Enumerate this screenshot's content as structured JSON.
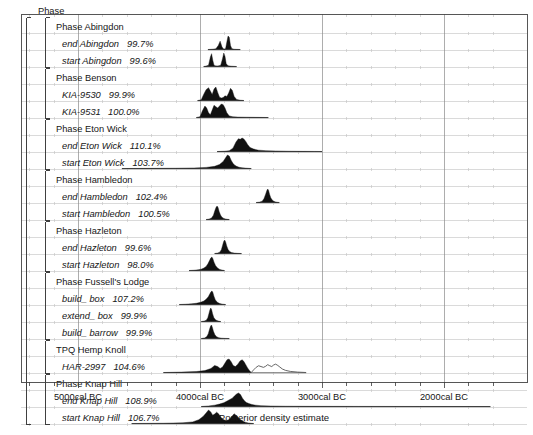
{
  "figure": {
    "axis_title": "Posterior density estimate",
    "root_label": "Phase",
    "frame": {
      "x": 21,
      "y": 14,
      "width": 506,
      "height": 368
    },
    "plot_left_px": 195,
    "colors": {
      "fill": "#111111",
      "outline": "#555555",
      "frame": "#444444",
      "grid_major": "#8a8a8a",
      "grid_minor": "#c8c8c8",
      "row_rule": "#b8b8b8",
      "text": "#161616"
    }
  },
  "x_axis": {
    "ticks": [
      {
        "label": "5000cal BC",
        "value": -5000,
        "x": 78
      },
      {
        "label": "4000cal BC",
        "value": -4000,
        "x": 200
      },
      {
        "label": "3000cal BC",
        "value": -3000,
        "x": 322
      },
      {
        "label": "2000cal BC",
        "value": -2000,
        "x": 444
      }
    ],
    "minor_tick_interval_years": 200,
    "px_per_1000_years": 122,
    "range": [
      -5450,
      -1550
    ]
  },
  "rows": [
    {
      "id": "phase-abingdon",
      "label": "Phase Abingdon",
      "kind": "phase",
      "indent": 2,
      "percent": "",
      "y": 33
    },
    {
      "id": "end-abingdon",
      "label": "end Abingdon",
      "kind": "item",
      "indent": 3,
      "percent": "99.7%",
      "y": 50
    },
    {
      "id": "start-abingdon",
      "label": "start Abingdon",
      "kind": "item",
      "indent": 3,
      "percent": "99.6%",
      "y": 67
    },
    {
      "id": "phase-benson",
      "label": "Phase Benson",
      "kind": "phase",
      "indent": 2,
      "percent": "",
      "y": 84
    },
    {
      "id": "kia-9530",
      "label": "KIA-9530",
      "kind": "item",
      "indent": 3,
      "percent": "99.9%",
      "y": 101
    },
    {
      "id": "kia-9531",
      "label": "KIA-9531",
      "kind": "item",
      "indent": 3,
      "percent": "100.0%",
      "y": 118
    },
    {
      "id": "phase-eton-wick",
      "label": "Phase Eton Wick",
      "kind": "phase",
      "indent": 2,
      "percent": "",
      "y": 135
    },
    {
      "id": "end-eton-wick",
      "label": "end Eton Wick",
      "kind": "item",
      "indent": 3,
      "percent": "110.1%",
      "y": 152
    },
    {
      "id": "start-eton-wick",
      "label": "start Eton Wick",
      "kind": "item",
      "indent": 3,
      "percent": "103.7%",
      "y": 169
    },
    {
      "id": "phase-hambledon",
      "label": "Phase Hambledon",
      "kind": "phase",
      "indent": 2,
      "percent": "",
      "y": 186
    },
    {
      "id": "end-hambledon",
      "label": "end Hambledon",
      "kind": "item",
      "indent": 3,
      "percent": "102.4%",
      "y": 203
    },
    {
      "id": "start-hambledon",
      "label": "start Hambledon",
      "kind": "item",
      "indent": 3,
      "percent": "100.5%",
      "y": 220
    },
    {
      "id": "phase-hazleton",
      "label": "Phase Hazleton",
      "kind": "phase",
      "indent": 2,
      "percent": "",
      "y": 237
    },
    {
      "id": "end-hazleton",
      "label": "end Hazleton",
      "kind": "item",
      "indent": 3,
      "percent": "99.6%",
      "y": 254
    },
    {
      "id": "start-hazleton",
      "label": "start Hazleton",
      "kind": "item",
      "indent": 3,
      "percent": "98.0%",
      "y": 271
    },
    {
      "id": "phase-fussells-lodge",
      "label": "Phase Fussell's Lodge",
      "kind": "phase",
      "indent": 2,
      "percent": "",
      "y": 288
    },
    {
      "id": "build-box",
      "label": "build_ box",
      "kind": "item",
      "indent": 3,
      "percent": "107.2%",
      "y": 305
    },
    {
      "id": "extend-box",
      "label": "extend_ box",
      "kind": "item",
      "indent": 3,
      "percent": "99.9%",
      "y": 322
    },
    {
      "id": "build-barrow",
      "label": "build_ barrow",
      "kind": "item",
      "indent": 3,
      "percent": "99.9%",
      "y": 339
    },
    {
      "id": "tpq-hemp-knoll",
      "label": "TPQ Hemp Knoll",
      "kind": "phase",
      "indent": 2,
      "percent": "",
      "y": 356
    },
    {
      "id": "har-2997",
      "label": "HAR-2997",
      "kind": "item",
      "indent": 3,
      "percent": "104.6%",
      "y": 373
    },
    {
      "id": "phase-knap-hill",
      "label": "Phase Knap Hill",
      "kind": "phase",
      "indent": 2,
      "percent": "",
      "y": 390
    },
    {
      "id": "end-knap-hill",
      "label": "end Knap Hill",
      "kind": "item",
      "indent": 3,
      "percent": "108.9%",
      "y": 407
    },
    {
      "id": "start-knap-hill",
      "label": "start Knap Hill",
      "kind": "item",
      "indent": 3,
      "percent": "106.7%",
      "y": 424
    }
  ],
  "chart_data": {
    "type": "area",
    "title": "",
    "xlabel": "Posterior density estimate",
    "ylabel": "",
    "xlim": [
      -5450,
      -1550
    ],
    "grid": true,
    "legend": false,
    "note": "OxCal posterior density estimates; filled black = posterior, grey outline = prior/likelihood. Each series gives the calendar-year span of the baseline plus the density curve sampled across it.",
    "series": [
      {
        "name": "end Abingdon",
        "row": "end-abingdon",
        "agreement": 99.7,
        "baseline": [
          -3935,
          -3670
        ],
        "x": [
          -3935,
          -3900,
          -3870,
          -3850,
          -3835,
          -3820,
          -3810,
          -3800,
          -3790,
          -3780,
          -3770,
          -3760,
          -3750,
          -3740,
          -3730,
          -3720,
          -3700,
          -3670
        ],
        "y": [
          0,
          0.02,
          0.05,
          0.3,
          0.62,
          0.2,
          0.06,
          0.04,
          0.08,
          0.55,
          1.0,
          0.9,
          0.3,
          0.08,
          0.04,
          0.02,
          0.01,
          0
        ]
      },
      {
        "name": "start Abingdon",
        "row": "start-abingdon",
        "agreement": 99.6,
        "baseline": [
          -3970,
          -3700
        ],
        "x": [
          -3970,
          -3950,
          -3930,
          -3915,
          -3905,
          -3895,
          -3885,
          -3875,
          -3860,
          -3845,
          -3830,
          -3815,
          -3805,
          -3795,
          -3785,
          -3770,
          -3740,
          -3700
        ],
        "y": [
          0,
          0.03,
          0.1,
          0.7,
          0.95,
          0.45,
          0.1,
          0.05,
          0.04,
          0.05,
          0.1,
          0.6,
          1.0,
          0.75,
          0.2,
          0.05,
          0.02,
          0
        ]
      },
      {
        "name": "KIA-9530",
        "row": "kia-9530",
        "agreement": 99.9,
        "baseline": [
          -4020,
          -3640
        ],
        "x": [
          -4020,
          -3990,
          -3970,
          -3950,
          -3930,
          -3915,
          -3900,
          -3885,
          -3870,
          -3855,
          -3840,
          -3825,
          -3810,
          -3795,
          -3780,
          -3765,
          -3750,
          -3735,
          -3720,
          -3700,
          -3670,
          -3640
        ],
        "y": [
          0,
          0.05,
          0.45,
          0.8,
          0.95,
          0.7,
          0.45,
          0.85,
          1.0,
          0.6,
          0.25,
          0.18,
          0.22,
          0.35,
          0.3,
          0.55,
          0.9,
          0.75,
          0.3,
          0.08,
          0.02,
          0
        ]
      },
      {
        "name": "KIA-9531",
        "row": "kia-9531",
        "agreement": 100.0,
        "baseline": [
          -4030,
          -3440
        ],
        "x": [
          -4030,
          -4000,
          -3980,
          -3960,
          -3945,
          -3930,
          -3915,
          -3900,
          -3885,
          -3870,
          -3855,
          -3840,
          -3825,
          -3810,
          -3795,
          -3780,
          -3760,
          -3730,
          -3690,
          -3620,
          -3530,
          -3440
        ],
        "y": [
          0,
          0.06,
          0.5,
          0.85,
          0.7,
          0.35,
          0.2,
          0.55,
          0.9,
          0.8,
          0.7,
          0.85,
          1.0,
          0.95,
          0.7,
          0.35,
          0.12,
          0.05,
          0.03,
          0.02,
          0.01,
          0
        ]
      },
      {
        "name": "end Eton Wick",
        "row": "end-eton-wick",
        "agreement": 110.1,
        "baseline": [
          -3860,
          -3000
        ],
        "x": [
          -3860,
          -3800,
          -3760,
          -3730,
          -3705,
          -3685,
          -3670,
          -3655,
          -3640,
          -3625,
          -3610,
          -3590,
          -3560,
          -3520,
          -3460,
          -3380,
          -3280,
          -3160,
          -3060,
          -3000
        ],
        "y": [
          0,
          0.02,
          0.06,
          0.25,
          0.7,
          0.95,
          0.9,
          1.0,
          0.92,
          0.75,
          0.52,
          0.3,
          0.18,
          0.1,
          0.06,
          0.04,
          0.02,
          0.01,
          0.005,
          0
        ]
      },
      {
        "name": "start Eton Wick",
        "row": "start-eton-wick",
        "agreement": 103.7,
        "baseline": [
          -4640,
          -3580
        ],
        "x": [
          -4640,
          -4400,
          -4200,
          -4050,
          -3950,
          -3880,
          -3840,
          -3810,
          -3790,
          -3775,
          -3760,
          -3745,
          -3730,
          -3715,
          -3700,
          -3680,
          -3655,
          -3630,
          -3600,
          -3580
        ],
        "y": [
          0,
          0.01,
          0.02,
          0.04,
          0.08,
          0.16,
          0.3,
          0.52,
          0.8,
          1.0,
          0.92,
          0.62,
          0.38,
          0.24,
          0.16,
          0.09,
          0.05,
          0.03,
          0.01,
          0
        ]
      },
      {
        "name": "end Hambledon",
        "row": "end-hambledon",
        "agreement": 102.4,
        "baseline": [
          -3540,
          -3350
        ],
        "x": [
          -3540,
          -3510,
          -3490,
          -3475,
          -3462,
          -3452,
          -3445,
          -3438,
          -3430,
          -3420,
          -3408,
          -3395,
          -3380,
          -3365,
          -3350
        ],
        "y": [
          0,
          0.03,
          0.1,
          0.3,
          0.62,
          0.88,
          1.0,
          0.9,
          0.62,
          0.35,
          0.18,
          0.09,
          0.04,
          0.015,
          0
        ]
      },
      {
        "name": "start Hambledon",
        "row": "start-hambledon",
        "agreement": 100.5,
        "baseline": [
          -3950,
          -3760
        ],
        "x": [
          -3950,
          -3925,
          -3905,
          -3890,
          -3878,
          -3868,
          -3860,
          -3852,
          -3843,
          -3832,
          -3820,
          -3805,
          -3790,
          -3775,
          -3760
        ],
        "y": [
          0,
          0.03,
          0.12,
          0.32,
          0.66,
          0.9,
          1.0,
          0.88,
          0.6,
          0.33,
          0.16,
          0.08,
          0.035,
          0.012,
          0
        ]
      },
      {
        "name": "end Hazleton",
        "row": "end-hazleton",
        "agreement": 99.6,
        "baseline": [
          -3880,
          -3660
        ],
        "x": [
          -3880,
          -3855,
          -3838,
          -3825,
          -3815,
          -3806,
          -3798,
          -3790,
          -3781,
          -3770,
          -3757,
          -3742,
          -3720,
          -3690,
          -3660
        ],
        "y": [
          0,
          0.03,
          0.1,
          0.28,
          0.6,
          0.88,
          1.0,
          0.86,
          0.56,
          0.3,
          0.15,
          0.07,
          0.03,
          0.01,
          0
        ]
      },
      {
        "name": "start Hazleton",
        "row": "start-hazleton",
        "agreement": 98.0,
        "baseline": [
          -4090,
          -3800
        ],
        "x": [
          -4090,
          -4050,
          -4015,
          -3990,
          -3968,
          -3950,
          -3935,
          -3922,
          -3912,
          -3903,
          -3895,
          -3885,
          -3872,
          -3856,
          -3838,
          -3820,
          -3800
        ],
        "y": [
          0,
          0.02,
          0.05,
          0.1,
          0.18,
          0.3,
          0.5,
          0.74,
          0.92,
          1.0,
          0.88,
          0.62,
          0.36,
          0.18,
          0.08,
          0.03,
          0
        ]
      },
      {
        "name": "build_ box",
        "row": "build-box",
        "agreement": 107.2,
        "baseline": [
          -4170,
          -3790
        ],
        "x": [
          -4170,
          -4120,
          -4070,
          -4030,
          -3995,
          -3968,
          -3948,
          -3932,
          -3920,
          -3910,
          -3902,
          -3895,
          -3886,
          -3874,
          -3858,
          -3838,
          -3815,
          -3790
        ],
        "y": [
          0,
          0.02,
          0.05,
          0.09,
          0.16,
          0.26,
          0.4,
          0.58,
          0.78,
          0.94,
          1.0,
          0.9,
          0.62,
          0.34,
          0.16,
          0.07,
          0.025,
          0
        ]
      },
      {
        "name": "extend_ box",
        "row": "extend-box",
        "agreement": 99.9,
        "baseline": [
          -3990,
          -3830
        ],
        "x": [
          -3990,
          -3965,
          -3948,
          -3936,
          -3927,
          -3919,
          -3912,
          -3905,
          -3897,
          -3887,
          -3875,
          -3862,
          -3848,
          -3838,
          -3830
        ],
        "y": [
          0,
          0.03,
          0.1,
          0.28,
          0.58,
          0.86,
          1.0,
          0.88,
          0.58,
          0.3,
          0.15,
          0.07,
          0.03,
          0.01,
          0
        ]
      },
      {
        "name": "build_ barrow",
        "row": "build-barrow",
        "agreement": 99.9,
        "baseline": [
          -3990,
          -3760
        ],
        "x": [
          -3990,
          -3962,
          -3944,
          -3932,
          -3922,
          -3913,
          -3906,
          -3899,
          -3890,
          -3878,
          -3864,
          -3846,
          -3824,
          -3795,
          -3760
        ],
        "y": [
          0,
          0.04,
          0.14,
          0.36,
          0.68,
          0.92,
          1.0,
          0.84,
          0.54,
          0.28,
          0.13,
          0.06,
          0.025,
          0.008,
          0
        ]
      },
      {
        "name": "HAR-2997 (posterior)",
        "row": "har-2997",
        "agreement": 104.6,
        "style": "filled",
        "baseline": [
          -4300,
          -3130
        ],
        "x": [
          -4300,
          -4150,
          -4030,
          -3960,
          -3910,
          -3880,
          -3855,
          -3835,
          -3815,
          -3795,
          -3778,
          -3762,
          -3745,
          -3728,
          -3710,
          -3690,
          -3672,
          -3655,
          -3640,
          -3625,
          -3610,
          -3595,
          -3580
        ],
        "y": [
          0,
          0.03,
          0.07,
          0.14,
          0.3,
          0.52,
          0.44,
          0.3,
          0.4,
          0.7,
          0.95,
          1.0,
          0.8,
          0.52,
          0.44,
          0.62,
          0.85,
          0.95,
          0.82,
          0.58,
          0.34,
          0.15,
          0
        ]
      },
      {
        "name": "HAR-2997 (prior)",
        "row": "har-2997",
        "style": "outline",
        "baseline": [
          -4300,
          -3130
        ],
        "x": [
          -3580,
          -3560,
          -3540,
          -3520,
          -3500,
          -3480,
          -3462,
          -3445,
          -3428,
          -3412,
          -3396,
          -3380,
          -3362,
          -3345,
          -3325,
          -3300,
          -3260,
          -3200,
          -3130
        ],
        "y": [
          0,
          0.2,
          0.38,
          0.5,
          0.44,
          0.38,
          0.46,
          0.58,
          0.5,
          0.44,
          0.56,
          0.62,
          0.52,
          0.4,
          0.26,
          0.16,
          0.08,
          0.03,
          0
        ]
      },
      {
        "name": "end Knap Hill",
        "row": "end-knap-hill",
        "agreement": 108.9,
        "baseline": [
          -3990,
          -1620
        ],
        "x": [
          -3990,
          -3930,
          -3880,
          -3840,
          -3805,
          -3778,
          -3755,
          -3735,
          -3718,
          -3700,
          -3684,
          -3668,
          -3652,
          -3636,
          -3620,
          -3600,
          -3575,
          -3545,
          -3500,
          -3420,
          -3300,
          -3100,
          -2700,
          -2200,
          -1620
        ],
        "y": [
          0,
          0.04,
          0.1,
          0.18,
          0.28,
          0.4,
          0.52,
          0.62,
          0.78,
          0.92,
          1.0,
          0.88,
          0.62,
          0.42,
          0.3,
          0.22,
          0.15,
          0.1,
          0.06,
          0.035,
          0.02,
          0.012,
          0.006,
          0.002,
          0
        ]
      },
      {
        "name": "start Knap Hill",
        "row": "start-knap-hill",
        "agreement": 106.7,
        "baseline": [
          -4560,
          -3560
        ],
        "x": [
          -4560,
          -4300,
          -4140,
          -4060,
          -4010,
          -3975,
          -3950,
          -3930,
          -3912,
          -3896,
          -3880,
          -3864,
          -3848,
          -3832,
          -3816,
          -3800,
          -3784,
          -3768,
          -3752,
          -3736,
          -3720,
          -3700,
          -3678,
          -3655,
          -3630,
          -3605,
          -3580,
          -3560
        ],
        "y": [
          0,
          0.02,
          0.05,
          0.12,
          0.28,
          0.52,
          0.78,
          1.0,
          0.86,
          0.62,
          0.7,
          0.84,
          0.72,
          0.5,
          0.34,
          0.26,
          0.22,
          0.26,
          0.38,
          0.56,
          0.72,
          0.58,
          0.36,
          0.2,
          0.1,
          0.04,
          0.012,
          0
        ]
      }
    ]
  }
}
